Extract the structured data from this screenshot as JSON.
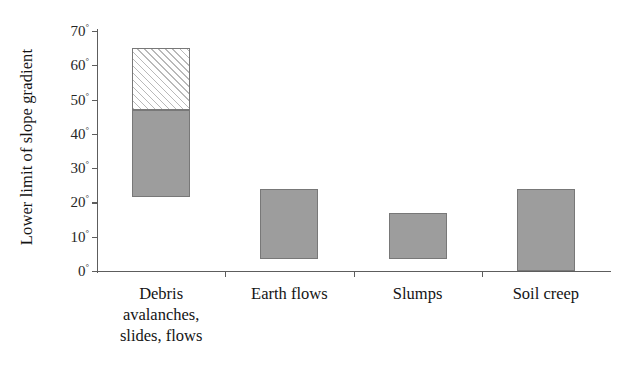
{
  "chart_data": {
    "type": "bar",
    "title": "",
    "xlabel": "",
    "ylabel": "Lower limit of slope gradient",
    "ylim": [
      0,
      70
    ],
    "ytick_step": 10,
    "ytick_labels": [
      "0",
      "10",
      "20",
      "30",
      "40",
      "50",
      "60",
      "70"
    ],
    "ytick_suffix": "°",
    "grid": false,
    "legend": "none",
    "orientation": "vertical",
    "bar_style": "floating range bars (low-high), some segmented",
    "categories": [
      "Debris avalanches, slides, flows",
      "Earth flows",
      "Slumps",
      "Soil creep"
    ],
    "category_lines": [
      [
        "Debris",
        "avalanches,",
        "slides, flows"
      ],
      [
        "Earth flows"
      ],
      [
        "Slumps"
      ],
      [
        "Soil creep"
      ]
    ],
    "bars": [
      {
        "category": "Debris avalanches, slides, flows",
        "low": 21.5,
        "high": 65,
        "segments": [
          {
            "from": 21.5,
            "to": 47,
            "fill": "solid-gray"
          },
          {
            "from": 47,
            "to": 65,
            "fill": "diagonal-hatch"
          }
        ]
      },
      {
        "category": "Earth flows",
        "low": 3.5,
        "high": 24,
        "segments": [
          {
            "from": 3.5,
            "to": 24,
            "fill": "solid-gray"
          }
        ]
      },
      {
        "category": "Slumps",
        "low": 3.5,
        "high": 17,
        "segments": [
          {
            "from": 3.5,
            "to": 17,
            "fill": "solid-gray"
          }
        ]
      },
      {
        "category": "Soil creep",
        "low": 0,
        "high": 24,
        "segments": [
          {
            "from": 0,
            "to": 24,
            "fill": "solid-gray"
          }
        ]
      }
    ],
    "colors": {
      "solid_gray": "#9d9d9d",
      "hatch_line": "#b9b9b9",
      "hatch_background": "#ffffff",
      "bar_border": "#787878",
      "axis": "#5d5d5d",
      "text": "#141414",
      "background": "#ffffff"
    }
  }
}
